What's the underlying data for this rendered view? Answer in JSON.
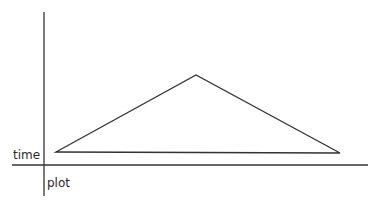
{
  "diagram": {
    "labels": {
      "y_axis": "time",
      "x_axis": "plot"
    },
    "colors": {
      "stroke": "#333333",
      "background": "#ffffff"
    },
    "axes": {
      "vertical": {
        "x": 44,
        "y1": 12,
        "y2": 196
      },
      "horizontal": {
        "y": 165,
        "x1": 12,
        "x2": 368
      }
    },
    "triangle": {
      "points": [
        [
          56,
          152
        ],
        [
          196,
          75
        ],
        [
          340,
          153
        ]
      ]
    }
  }
}
